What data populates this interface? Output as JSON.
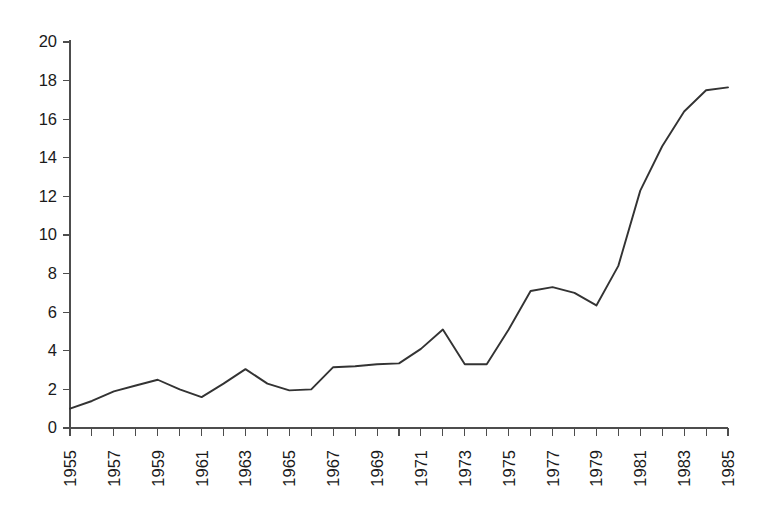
{
  "chart_data": {
    "type": "line",
    "title": "",
    "subtitle": "",
    "xlabel": "",
    "ylabel": "",
    "xlim": [
      1955,
      1985
    ],
    "ylim": [
      0,
      20
    ],
    "grid": false,
    "legend": false,
    "legend_position": "none",
    "line_color": "#333333",
    "axis_color": "#4d4d4d",
    "background_color": "#ffffff",
    "y_ticks": [
      0,
      2,
      4,
      6,
      8,
      10,
      12,
      14,
      16,
      18,
      20
    ],
    "y_tick_labels": [
      "0",
      "2",
      "4",
      "6",
      "8",
      "10",
      "12",
      "14",
      "16",
      "18",
      "20"
    ],
    "y_tick_step": 2,
    "x_ticks": [
      1955,
      1956,
      1957,
      1958,
      1959,
      1960,
      1961,
      1962,
      1963,
      1964,
      1965,
      1966,
      1967,
      1968,
      1969,
      1970,
      1971,
      1972,
      1973,
      1974,
      1975,
      1976,
      1977,
      1978,
      1979,
      1980,
      1981,
      1982,
      1983,
      1984,
      1985
    ],
    "x_tick_labels": [
      "1955",
      "",
      "1957",
      "",
      "1959",
      "",
      "1961",
      "",
      "1963",
      "",
      "1965",
      "",
      "1967",
      "",
      "1969",
      "",
      "1971",
      "",
      "1973",
      "",
      "1975",
      "",
      "1977",
      "",
      "1979",
      "",
      "1981",
      "",
      "1983",
      "",
      "1985"
    ],
    "x_label_rotation": -90,
    "x": [
      1955,
      1956,
      1957,
      1958,
      1959,
      1960,
      1961,
      1962,
      1963,
      1964,
      1965,
      1966,
      1967,
      1968,
      1969,
      1970,
      1971,
      1972,
      1973,
      1974,
      1975,
      1976,
      1977,
      1978,
      1979,
      1980,
      1981,
      1982,
      1983,
      1984,
      1985
    ],
    "values": [
      1.0,
      1.4,
      1.9,
      2.2,
      2.5,
      2.0,
      1.6,
      2.3,
      3.05,
      2.3,
      1.95,
      2.0,
      3.15,
      3.2,
      3.3,
      3.35,
      4.1,
      5.1,
      3.3,
      3.3,
      5.1,
      7.1,
      7.3,
      7.0,
      6.35,
      8.4,
      12.3,
      14.6,
      16.4,
      17.5,
      17.65
    ],
    "annotations": []
  }
}
